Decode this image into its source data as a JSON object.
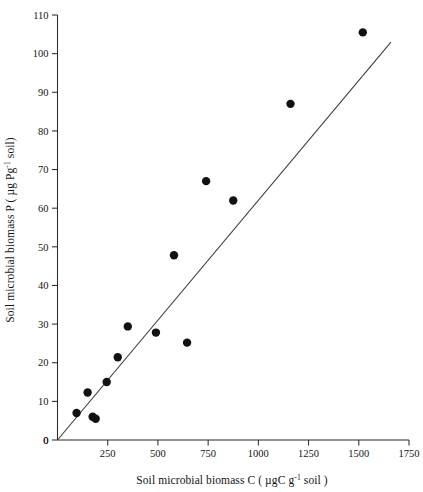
{
  "chart_data": {
    "type": "scatter",
    "title": "",
    "xlabel": "Soil microbial biomass C ( µgC g⁻¹ soil )",
    "ylabel": "Soil microbial biomass P ( µg Pg⁻¹ soil)",
    "xlabel_parts": {
      "pre": "Soil microbial biomass C ( µgC g",
      "sup": "-1",
      "post": " soil )"
    },
    "ylabel_parts": {
      "pre": "Soil microbial biomass P ( µg Pg",
      "sup": "-1",
      "post": " soil)"
    },
    "xlim": [
      0,
      1750
    ],
    "ylim": [
      0,
      110
    ],
    "xticks": [
      0,
      250,
      500,
      750,
      1000,
      1250,
      1500,
      1750
    ],
    "yticks": [
      0,
      10,
      20,
      30,
      40,
      50,
      60,
      70,
      80,
      90,
      100,
      110
    ],
    "xtick_labels": [
      "0",
      "250",
      "500",
      "750",
      "1000",
      "1250",
      "1500",
      "1750"
    ],
    "ytick_labels": [
      "0",
      "10",
      "20",
      "30",
      "40",
      "50",
      "60",
      "70",
      "80",
      "90",
      "100",
      "110"
    ],
    "grid": false,
    "legend": null,
    "marker": "filled-circle",
    "marker_color": "#121212",
    "marker_size_px": 4.2,
    "line_color": "#3a3a3a",
    "axis_color": "#2b2b2b",
    "background": "#ffffff",
    "x": [
      95,
      150,
      175,
      190,
      245,
      300,
      305,
      350,
      490,
      580,
      645,
      740,
      875,
      1160,
      1520
    ],
    "y": [
      7,
      12.3,
      6,
      5.5,
      15,
      21.4,
      29.4,
      29.4,
      27.8,
      47.8,
      25.2,
      67,
      62,
      87,
      105.5
    ],
    "points": [
      {
        "x": 95,
        "y": 7.0
      },
      {
        "x": 150,
        "y": 12.3
      },
      {
        "x": 175,
        "y": 6.0
      },
      {
        "x": 190,
        "y": 5.5
      },
      {
        "x": 245,
        "y": 15.0
      },
      {
        "x": 300,
        "y": 21.4
      },
      {
        "x": 350,
        "y": 29.4
      },
      {
        "x": 490,
        "y": 27.8
      },
      {
        "x": 580,
        "y": 47.8
      },
      {
        "x": 645,
        "y": 25.2
      },
      {
        "x": 740,
        "y": 67.0
      },
      {
        "x": 875,
        "y": 62.0
      },
      {
        "x": 1160,
        "y": 87.0
      },
      {
        "x": 1520,
        "y": 105.5
      }
    ],
    "trendline": {
      "type": "linear",
      "x_start": 0,
      "y_start": 0,
      "x_end": 1660,
      "y_end": 103,
      "slope": 0.062,
      "intercept": 0
    }
  }
}
